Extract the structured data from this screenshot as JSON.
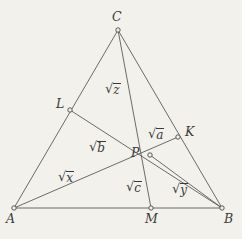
{
  "figure": {
    "background_color": "#f3f1ec",
    "stroke_color": "#5b5b5b",
    "width": 242,
    "height": 239,
    "points": [
      {
        "id": "C",
        "label": "C",
        "x": 118,
        "y": 30,
        "label_x": 112,
        "label_y": 11
      },
      {
        "id": "L",
        "label": "L",
        "x": 70,
        "y": 110,
        "label_x": 56,
        "label_y": 98
      },
      {
        "id": "K",
        "label": "K",
        "x": 178,
        "y": 137,
        "label_x": 185,
        "label_y": 126
      },
      {
        "id": "P",
        "label": "P",
        "x": 150,
        "y": 155,
        "label_x": 131,
        "label_y": 147
      },
      {
        "id": "A",
        "label": "A",
        "x": 14,
        "y": 208,
        "label_x": 6,
        "label_y": 213
      },
      {
        "id": "M",
        "label": "M",
        "x": 151,
        "y": 208,
        "label_x": 145,
        "label_y": 213
      },
      {
        "id": "B",
        "label": "B",
        "x": 222,
        "y": 208,
        "label_x": 224,
        "label_y": 213
      }
    ],
    "segments": [
      {
        "id": "AC",
        "from": "A",
        "to": "C"
      },
      {
        "id": "CB",
        "from": "C",
        "to": "B"
      },
      {
        "id": "AB",
        "from": "A",
        "to": "B"
      },
      {
        "id": "CM",
        "from": "C",
        "to": "M"
      },
      {
        "id": "LB",
        "from": "L",
        "to": "B"
      },
      {
        "id": "AK",
        "from": "A",
        "to": "K"
      },
      {
        "id": "PB",
        "from": "P",
        "to": "B"
      }
    ],
    "region_labels": [
      {
        "id": "z",
        "sign": "√",
        "arg": "z",
        "x": 105,
        "y": 82
      },
      {
        "id": "b",
        "sign": "√",
        "arg": "b",
        "x": 89,
        "y": 140
      },
      {
        "id": "a",
        "sign": "√",
        "arg": "a",
        "x": 148,
        "y": 127
      },
      {
        "id": "x",
        "sign": "√",
        "arg": "x",
        "x": 58,
        "y": 170
      },
      {
        "id": "c",
        "sign": "√",
        "arg": "c",
        "x": 126,
        "y": 180
      },
      {
        "id": "y",
        "sign": "√",
        "arg": "y",
        "x": 172,
        "y": 182
      }
    ]
  }
}
